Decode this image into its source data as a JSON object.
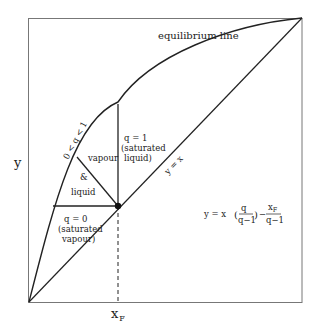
{
  "diagram": {
    "type": "McCabe-Thiele q-line diagram",
    "axes": {
      "y_label": "y",
      "x_marker_label": "x",
      "x_marker_subscript": "F"
    },
    "labels": {
      "equilibrium_line": "equilibrium line",
      "diagonal": "y = x",
      "q_one_line1": "q = 1",
      "q_one_line2": "(saturated",
      "q_one_line3": "liquid)",
      "q_zero_line1": "q = 0",
      "q_zero_line2": "(saturated",
      "q_zero_line3": "vapour)",
      "two_phase_range": "0 < q < 1",
      "two_phase_line1": "vapour",
      "two_phase_line2": "&",
      "two_phase_line3": "liquid"
    },
    "equation": {
      "lhs": "y = x",
      "frac1_num": "q",
      "frac1_den": "q−1",
      "minus": "−",
      "frac2_num": "x",
      "frac2_num_sub": "F",
      "frac2_den": "q−1"
    },
    "colors": {
      "line": "#222222",
      "frame": "#777777",
      "background": "#ffffff"
    }
  }
}
